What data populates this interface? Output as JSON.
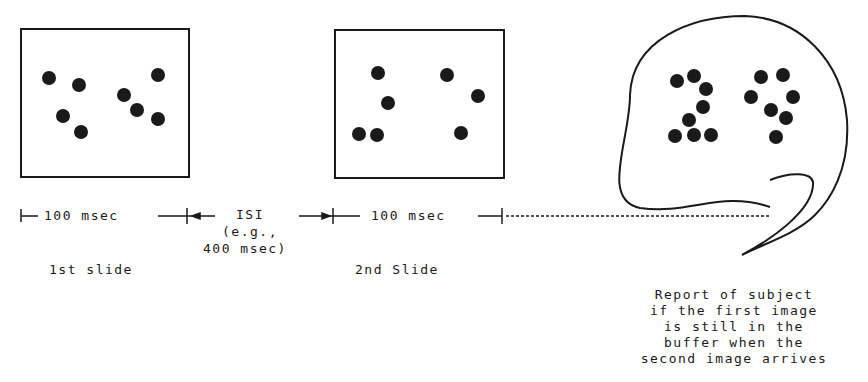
{
  "diagram": {
    "slide1": {
      "label": "1st slide",
      "duration": "100 msec",
      "dots": [
        [
          49,
          78
        ],
        [
          79,
          85
        ],
        [
          63,
          116
        ],
        [
          81,
          132
        ],
        [
          124,
          95
        ],
        [
          137,
          110
        ],
        [
          158,
          75
        ],
        [
          158,
          119
        ]
      ]
    },
    "isi": {
      "line1": "ISI",
      "line2": "(e.g.,",
      "line3": "400 msec)"
    },
    "slide2": {
      "label": "2nd Slide",
      "duration": "100 msec",
      "dots": [
        [
          378,
          73
        ],
        [
          388,
          103
        ],
        [
          359,
          134
        ],
        [
          377,
          135
        ],
        [
          447,
          75
        ],
        [
          478,
          96
        ],
        [
          461,
          133
        ]
      ]
    },
    "buffer": {
      "dots": [
        [
          677,
          81
        ],
        [
          694,
          76
        ],
        [
          706,
          89
        ],
        [
          703,
          107
        ],
        [
          689,
          120
        ],
        [
          675,
          136
        ],
        [
          694,
          135
        ],
        [
          711,
          135
        ],
        [
          761,
          77
        ],
        [
          783,
          75
        ],
        [
          751,
          97
        ],
        [
          793,
          97
        ],
        [
          771,
          110
        ],
        [
          786,
          118
        ],
        [
          776,
          137
        ]
      ],
      "caption_lines": [
        "Report of subject",
        "if the first image",
        "is still in the",
        "buffer when the",
        "second image arrives"
      ]
    }
  }
}
